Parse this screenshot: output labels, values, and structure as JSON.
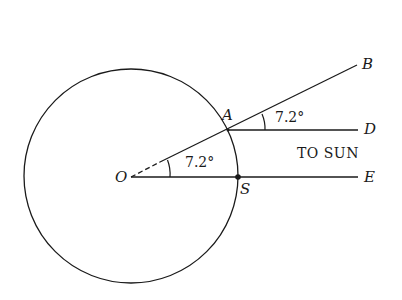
{
  "diagram": {
    "title": "",
    "points": {
      "O": "O",
      "A": "A",
      "S": "S",
      "B": "B",
      "D": "D",
      "E": "E"
    },
    "angles": {
      "center_angle": "7.2°",
      "ray_angle": "7.2°"
    },
    "annotations": {
      "sun_direction": "TO SUN"
    },
    "colors": {
      "stroke": "#1a1a1a",
      "background": "#ffffff"
    }
  }
}
